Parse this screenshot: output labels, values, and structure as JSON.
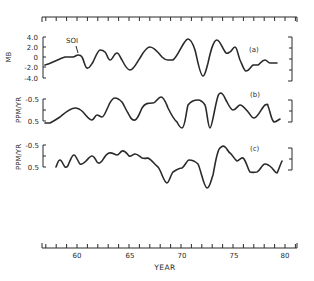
{
  "chart_data": {
    "type": "line",
    "title": "",
    "xlabel": "YEAR",
    "x_tick_labels": [
      "60",
      "65",
      "70",
      "75",
      "80"
    ],
    "x_ticks": [
      60,
      65,
      70,
      75,
      80
    ],
    "xlim": [
      56.6,
      81.2
    ],
    "minor_tick_step_years": 1,
    "grid": false,
    "legend": "none",
    "panels": [
      {
        "id": "a",
        "tag": "(a)",
        "ylabel": "MB",
        "y_tick_labels": [
          "4.0",
          "2.0",
          "0",
          "-2.0",
          "-4.0"
        ],
        "ylim": [
          -4.0,
          4.0
        ],
        "annotation": "SOI",
        "series": [
          {
            "name": "SOI",
            "x": [
              56.8,
              57.6,
              58.7,
              59.5,
              60.1,
              60.5,
              61.0,
              61.6,
              62.3,
              62.7,
              63.2,
              63.9,
              64.6,
              65.0,
              66.0,
              67.2,
              68.3,
              68.7,
              69.6,
              70.3,
              71.1,
              71.6,
              72.3,
              72.9,
              73.8,
              74.7,
              75.1,
              75.6,
              76.1,
              76.7,
              77.4,
              77.8,
              78.5,
              79.0,
              79.7
            ],
            "y": [
              -1.6,
              -1.0,
              0.0,
              0.0,
              0.4,
              0.0,
              -2.2,
              -1.0,
              1.4,
              1.0,
              -0.6,
              0.8,
              -0.6,
              -2.6,
              0.0,
              2.0,
              -0.6,
              -0.6,
              3.6,
              1.4,
              -3.8,
              -1.2,
              3.4,
              0.8,
              1.0,
              2.0,
              -0.6,
              -2.8,
              -1.6,
              -1.6,
              -0.6,
              -1.2,
              -1.2,
              -1.4,
              -1.6
            ]
          }
        ]
      },
      {
        "id": "b",
        "tag": "(b)",
        "ylabel": "PPM/YR",
        "y_tick_labels": [
          "-0.5",
          "0.5"
        ],
        "ylim_inverted": [
          -0.5,
          0.5
        ],
        "series": [
          {
            "name": "CO2 growth rate residual (b)",
            "x": [
              56.7,
              57.6,
              59.4,
              60.4,
              61.4,
              61.9,
              62.4,
              63.0,
              63.7,
              64.4,
              65.0,
              65.7,
              66.5,
              67.3,
              68.1,
              68.5,
              69.4,
              70.1,
              70.6,
              71.1,
              71.8,
              72.1,
              73.0,
              73.7,
              74.3,
              75.0,
              76.2,
              77.5,
              78.4
            ],
            "y": [
              0.6,
              0.35,
              -0.05,
              0.12,
              0.5,
              0.28,
              0.36,
              -0.08,
              -0.5,
              -0.32,
              0.15,
              0.5,
              -0.12,
              -0.18,
              -0.45,
              0.05,
              0.58,
              0.92,
              -0.1,
              -0.3,
              -0.08,
              0.82,
              -0.68,
              -0.3,
              0.05,
              -0.18,
              0.4,
              -0.18,
              0.6
            ]
          }
        ]
      },
      {
        "id": "c",
        "tag": "(c)",
        "ylabel": "PPM/YR",
        "y_tick_labels": [
          "-0.5",
          "0.5"
        ],
        "ylim_inverted": [
          -0.5,
          0.5
        ],
        "series": [
          {
            "name": "CO2 growth rate residual (c)",
            "x": [
              56.8,
              57.2,
              57.6,
              58.3,
              58.7,
              59.2,
              59.8,
              60.4,
              60.9,
              61.5,
              62.0,
              62.6,
              63.1,
              63.6,
              64.2,
              64.7,
              65.3,
              66.0,
              66.8,
              67.5,
              67.8,
              68.6,
              69.4,
              70.3,
              71.1,
              71.7,
              72.3,
              72.9,
              73.5,
              74.0,
              74.5,
              75.3,
              76.1,
              76.6,
              77.3,
              78.0,
              78.6,
              79.2,
              79.6,
              80.2
            ],
            "y": [
              0.5,
              0.15,
              0.4,
              0.05,
              0.35,
              -0.05,
              0.45,
              0.25,
              0.05,
              -0.12,
              -0.05,
              -0.2,
              0.05,
              -0.05,
              -0.1,
              0.28,
              0.85,
              0.6,
              0.18,
              -0.15,
              -0.1,
              0.58,
              1.3,
              0.35,
              0.1,
              0.55,
              0.75,
              0.88,
              0.22,
              1.0,
              -0.1,
              -1.2,
              -0.48,
              0.05,
              -0.05,
              0.58,
              0.65,
              0.3,
              0.5,
              -0.5
            ]
          }
        ]
      }
    ]
  },
  "labels": {
    "panel_a_tag": "(a)",
    "panel_b_tag": "(b)",
    "panel_c_tag": "(c)",
    "soi_annotation": "SOI",
    "ylabel_a": "MB",
    "ylabel_b": "PPM/YR",
    "ylabel_c": "PPM/YR",
    "yticks_a": [
      "4.0",
      "2.0",
      "0",
      "-2.0",
      "-4.0"
    ],
    "yticks_b": [
      "-0.5",
      "0.5"
    ],
    "yticks_c": [
      "-0.5",
      "0.5"
    ],
    "xticks": [
      "60",
      "65",
      "70",
      "75",
      "80"
    ],
    "xlabel": "YEAR"
  }
}
